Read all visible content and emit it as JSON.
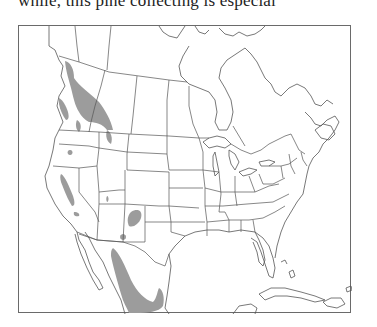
{
  "page": {
    "caption_fragment": "while, this pine collecting is especial"
  },
  "map": {
    "type": "species-range-map",
    "region": "North America",
    "range_color": "#9c9c9c",
    "outline_color": "#555555",
    "frame_color": "#6a6a6a",
    "range_areas": [
      "British Columbia coast and interior",
      "Vancouver Island",
      "Northern Idaho / Montana border",
      "Washington / Oregon patches",
      "Sierra Nevada, California",
      "Southern California",
      "Utah",
      "Colorado",
      "New Mexico",
      "Sierra Madre Occidental, Mexico",
      "Southern Mexico"
    ]
  }
}
